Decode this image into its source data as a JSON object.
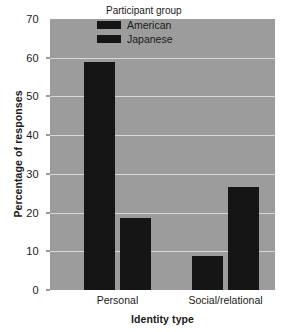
{
  "chart_data": {
    "type": "bar",
    "title": "",
    "subtitle": "",
    "xlabel": "Identity type",
    "ylabel": "Percentage of responses",
    "categories": [
      "Personal",
      "Social/relational"
    ],
    "series": [
      {
        "name": "American",
        "values": [
          59,
          8.8
        ],
        "color": "#151515"
      },
      {
        "name": "Japanese",
        "values": [
          18.6,
          26.6
        ],
        "color": "#151515"
      }
    ],
    "ylim": [
      0,
      70
    ],
    "yticks": [
      0,
      10,
      20,
      30,
      40,
      50,
      60,
      70
    ],
    "ytick_labels": [
      "0",
      "10",
      "20",
      "30",
      "40",
      "50",
      "60",
      "70"
    ],
    "grid": true,
    "grid_color": "#d8d8d8",
    "legend": {
      "title": "Participant group",
      "position": "top-center-inside",
      "entries": [
        {
          "label": "American",
          "color": "#151515"
        },
        {
          "label": "Japanese",
          "color": "#151515"
        }
      ]
    },
    "plot_background": "#9c9c9c",
    "figure_background": "#ffffff",
    "bars": [
      {
        "group": "Personal",
        "series": "American",
        "value": 59
      },
      {
        "group": "Personal",
        "series": "Japanese",
        "value": 18.6
      },
      {
        "group": "Social/relational",
        "series": "American",
        "value": 8.8
      },
      {
        "group": "Social/relational",
        "series": "Japanese",
        "value": 26.6
      }
    ]
  }
}
